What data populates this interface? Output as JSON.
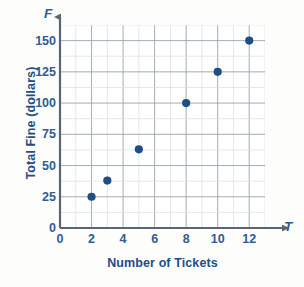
{
  "chart_data": {
    "type": "scatter",
    "title": "",
    "xlabel": "Number of Tickets",
    "ylabel": "Total Fine (dollars)",
    "x_axis_symbol": "T",
    "y_axis_symbol": "F",
    "xlim": [
      0,
      13
    ],
    "ylim": [
      0,
      162.5
    ],
    "x_ticks": [
      0,
      2,
      4,
      6,
      8,
      10,
      12
    ],
    "y_ticks": [
      0,
      25,
      50,
      75,
      100,
      125,
      150
    ],
    "x_tick_labels": [
      "0",
      "2",
      "4",
      "6",
      "8",
      "10",
      "12"
    ],
    "y_tick_labels": [
      "0",
      "25",
      "50",
      "75",
      "100",
      "125",
      "150"
    ],
    "x_gridline_step": 1,
    "y_gridline_step": 12.5,
    "grid": true,
    "legend": false,
    "marker_color": "#1f4e87",
    "grid_color": "#9aa3ad",
    "minor_grid_color": "#d7dde3",
    "axis_color": "#5a6472",
    "text_color": "#1f4e87",
    "points": [
      {
        "x": 2,
        "y": 25
      },
      {
        "x": 3,
        "y": 38
      },
      {
        "x": 5,
        "y": 63
      },
      {
        "x": 8,
        "y": 100
      },
      {
        "x": 10,
        "y": 125
      },
      {
        "x": 12,
        "y": 150
      }
    ]
  }
}
